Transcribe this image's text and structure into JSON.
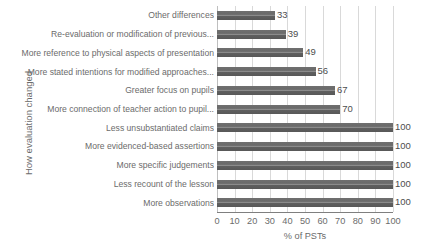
{
  "chart_data": {
    "type": "bar",
    "orientation": "horizontal",
    "title": "",
    "xlabel": "% of PSTs",
    "ylabel": "How evaluation changed",
    "xlim": [
      0,
      100
    ],
    "xticks": [
      0,
      10,
      20,
      30,
      40,
      50,
      60,
      70,
      80,
      90,
      100
    ],
    "grid": "vertical",
    "legend": "none",
    "bar_color": "#6f6f6f",
    "categories": [
      "Other differences",
      "Re-evaluation or modification of previous...",
      "More reference to physical aspects of presentation",
      "More stated intentions for modified approaches...",
      "Greater focus on pupils",
      "More connection of teacher action to pupil...",
      "Less unsubstantiated claims",
      "More evidenced-based assertions",
      "More specific judgements",
      "Less recount of the lesson",
      "More observations"
    ],
    "values": [
      33,
      39,
      49,
      56,
      67,
      70,
      100,
      100,
      100,
      100,
      100
    ],
    "value_labels": [
      "33",
      "39",
      "49",
      "56",
      "67",
      "70",
      "100",
      "100",
      "100",
      "100",
      "100"
    ]
  }
}
